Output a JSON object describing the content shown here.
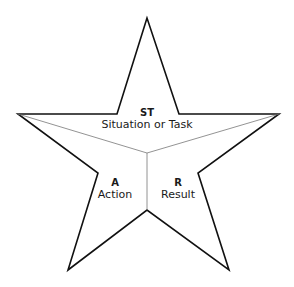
{
  "diagram": {
    "shape": "five-point-star",
    "sections": [
      {
        "key": "st",
        "abbr": "ST",
        "label": "Situation or Task"
      },
      {
        "key": "a",
        "abbr": "A",
        "label": "Action"
      },
      {
        "key": "r",
        "abbr": "R",
        "label": "Result"
      }
    ],
    "colors": {
      "outline": "#111111",
      "divider": "#777777",
      "fill": "#ffffff"
    }
  }
}
